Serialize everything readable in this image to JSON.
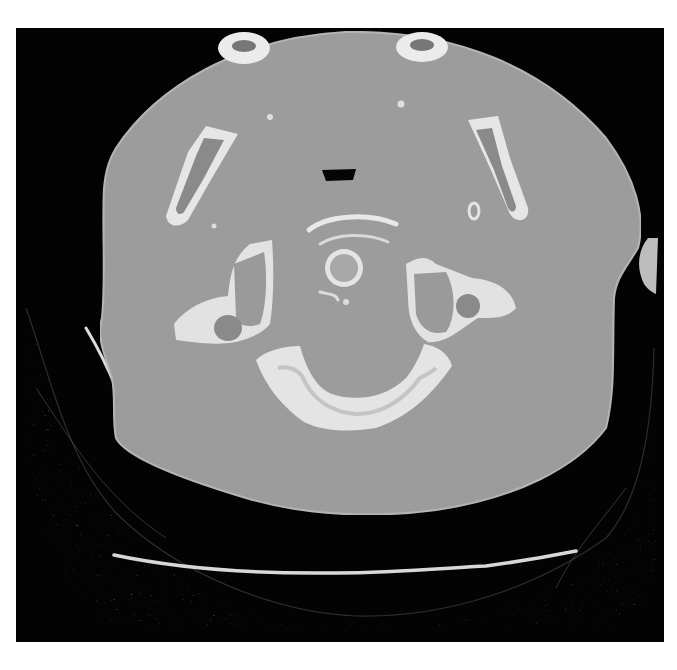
{
  "image": {
    "kind": "axial CT slice",
    "region": "upper neck / cervical spine (C1 atlas level)",
    "window": "bone window",
    "visible_text": []
  },
  "colors": {
    "background": "#030303",
    "soft_tissue": "#9c9c9c",
    "soft_tissue_edge": "#b4b4b4",
    "bone": "#e8e8e8",
    "bone_marrow": "#8a8a8a",
    "air": "#050505",
    "fat_strands": "#3a3a3a",
    "table_line": "#d6d6d6",
    "page_background": "#ffffff"
  },
  "structures": [
    {
      "name": "neck-soft-tissue",
      "label": "Neck soft tissue cross-section"
    },
    {
      "name": "atlas-anterior-arch",
      "label": "Anterior arch of atlas"
    },
    {
      "name": "dens",
      "label": "Odontoid process (dens)"
    },
    {
      "name": "atlas-lateral-mass-left",
      "label": "Lateral mass of atlas (image left)"
    },
    {
      "name": "atlas-lateral-mass-right",
      "label": "Lateral mass of atlas (image right)"
    },
    {
      "name": "transverse-foramen-left",
      "label": "Transverse foramen (image left)"
    },
    {
      "name": "transverse-foramen-right",
      "label": "Transverse foramen (image right)"
    },
    {
      "name": "atlas-posterior-arch",
      "label": "Posterior arch of atlas"
    },
    {
      "name": "mandible-ramus-left",
      "label": "Mandibular ramus (image left)"
    },
    {
      "name": "mandible-ramus-right",
      "label": "Mandibular ramus (image right)"
    },
    {
      "name": "mandible-condyle-left",
      "label": "Mandible section top-left"
    },
    {
      "name": "mandible-condyle-right",
      "label": "Mandible section top-right"
    },
    {
      "name": "airway",
      "label": "Oropharyngeal airway"
    },
    {
      "name": "styloid-calcification",
      "label": "Small calcification"
    },
    {
      "name": "shoulder-fat",
      "label": "Posterior subcutaneous fat / shoulders"
    },
    {
      "name": "scan-table-upper",
      "label": "Scanner table contour (upper)"
    },
    {
      "name": "scan-table-lower",
      "label": "Scanner table contour (lower)"
    },
    {
      "name": "ear-lobe-right",
      "label": "Right edge soft tissue (ear)"
    }
  ]
}
